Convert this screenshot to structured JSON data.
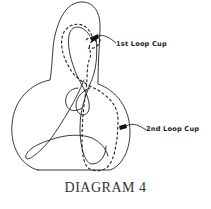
{
  "diagram": {
    "title": "DIAGRAM 4",
    "labels": {
      "first_cup": "1st Loop Cup",
      "second_cup": "2nd Loop Cup"
    },
    "line_color": "#222222",
    "background": "#ffffff"
  }
}
